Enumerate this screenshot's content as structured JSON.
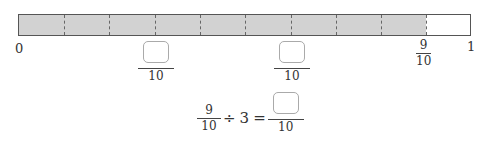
{
  "diagram": {
    "type": "number-line-bar",
    "divisions": 10,
    "shaded_divisions": 9,
    "fill_color": "#d2d2d2",
    "border_color": "#555555",
    "labels": {
      "start": "0",
      "end": "1",
      "marked_fraction": {
        "numerator": "9",
        "denominator": "10"
      }
    },
    "answer_boxes": [
      {
        "position": "2/10",
        "numerator": "",
        "denominator": "10"
      },
      {
        "position": "6/10",
        "numerator": "",
        "denominator": "10"
      }
    ]
  },
  "equation": {
    "left": {
      "numerator": "9",
      "denominator": "10"
    },
    "operator": "÷",
    "divisor": "3",
    "equals": "=",
    "result": {
      "numerator": "",
      "denominator": "10"
    }
  }
}
